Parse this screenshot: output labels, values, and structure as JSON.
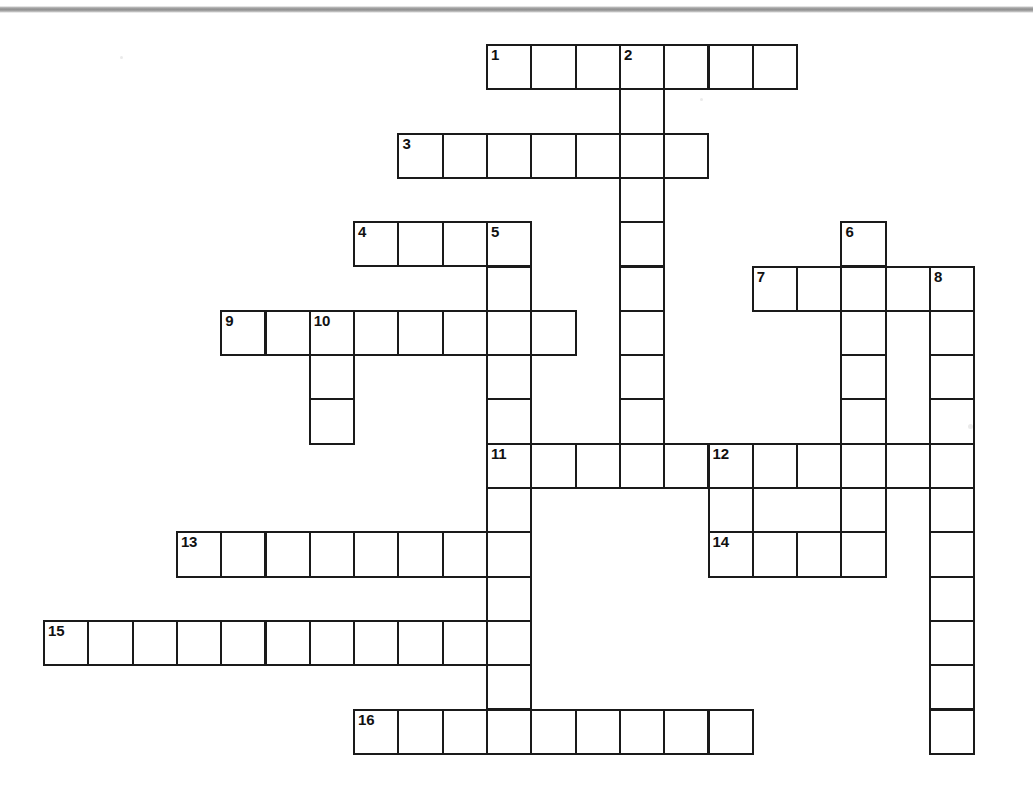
{
  "page": {
    "type": "crossword-puzzle-grid",
    "background_color": "#ffffff",
    "cell_border_color": "#1a1a1a",
    "cell_fill_color": "#ffffff",
    "number_color": "#111111",
    "rule_color": "#8f8f8f",
    "cell_size": 44.3,
    "origin": {
      "x": 43,
      "y": 44
    }
  },
  "grid": {
    "columns_x": [
      43,
      87.3,
      131.6,
      175.9,
      220.2,
      264.5,
      308.8,
      353.1,
      397.4,
      441.7,
      486,
      530.3,
      574.6,
      618.9,
      663.2,
      707.5,
      751.8,
      796.1,
      840.4,
      884.7,
      929,
      973.3
    ],
    "rows_y": [
      44,
      88.3,
      132.6,
      176.9,
      221.2,
      265.5,
      309.8,
      354.1,
      398.4,
      442.7,
      487,
      531.3,
      575.6,
      619.9,
      664.2,
      708.5,
      752.8
    ]
  },
  "entries": [
    {
      "number": "1",
      "direction": "across",
      "col": 10,
      "row": 0,
      "length": 7
    },
    {
      "number": "2",
      "direction": "down",
      "col": 13,
      "row": 0,
      "length": 10
    },
    {
      "number": "3",
      "direction": "across",
      "col": 8,
      "row": 2,
      "length": 7
    },
    {
      "number": "4",
      "direction": "across",
      "col": 7,
      "row": 4,
      "length": 4
    },
    {
      "number": "5",
      "direction": "down",
      "col": 10,
      "row": 4,
      "length": 12
    },
    {
      "number": "6",
      "direction": "down",
      "col": 18,
      "row": 4,
      "length": 8
    },
    {
      "number": "7",
      "direction": "across",
      "col": 16,
      "row": 5,
      "length": 5
    },
    {
      "number": "8",
      "direction": "down",
      "col": 20,
      "row": 5,
      "length": 11
    },
    {
      "number": "9",
      "direction": "across",
      "col": 4,
      "row": 6,
      "length": 8
    },
    {
      "number": "10",
      "direction": "down",
      "col": 6,
      "row": 6,
      "length": 3
    },
    {
      "number": "11",
      "direction": "across",
      "col": 10,
      "row": 9,
      "length": 10
    },
    {
      "number": "12",
      "direction": "down",
      "col": 15,
      "row": 9,
      "length": 3
    },
    {
      "number": "13",
      "direction": "across",
      "col": 3,
      "row": 11,
      "length": 8
    },
    {
      "number": "14",
      "direction": "across",
      "col": 15,
      "row": 11,
      "length": 3
    },
    {
      "number": "15",
      "direction": "across",
      "col": 0,
      "row": 13,
      "length": 11
    },
    {
      "number": "16",
      "direction": "across",
      "col": 7,
      "row": 15,
      "length": 9
    }
  ],
  "numbered_cells": [
    {
      "number": "1",
      "col": 10,
      "row": 0
    },
    {
      "number": "2",
      "col": 13,
      "row": 0
    },
    {
      "number": "3",
      "col": 8,
      "row": 2
    },
    {
      "number": "4",
      "col": 7,
      "row": 4
    },
    {
      "number": "5",
      "col": 10,
      "row": 4
    },
    {
      "number": "6",
      "col": 18,
      "row": 4
    },
    {
      "number": "7",
      "col": 16,
      "row": 5
    },
    {
      "number": "8",
      "col": 20,
      "row": 5
    },
    {
      "number": "9",
      "col": 4,
      "row": 6
    },
    {
      "number": "10",
      "col": 6,
      "row": 6
    },
    {
      "number": "11",
      "col": 10,
      "row": 9
    },
    {
      "number": "12",
      "col": 15,
      "row": 9
    },
    {
      "number": "13",
      "col": 3,
      "row": 11
    },
    {
      "number": "14",
      "col": 15,
      "row": 11
    },
    {
      "number": "15",
      "col": 0,
      "row": 13
    },
    {
      "number": "16",
      "col": 7,
      "row": 15
    }
  ],
  "specks": [
    {
      "x": 968,
      "y": 424,
      "size": 5
    },
    {
      "x": 120,
      "y": 56,
      "size": 3
    },
    {
      "x": 700,
      "y": 98,
      "size": 3
    }
  ]
}
